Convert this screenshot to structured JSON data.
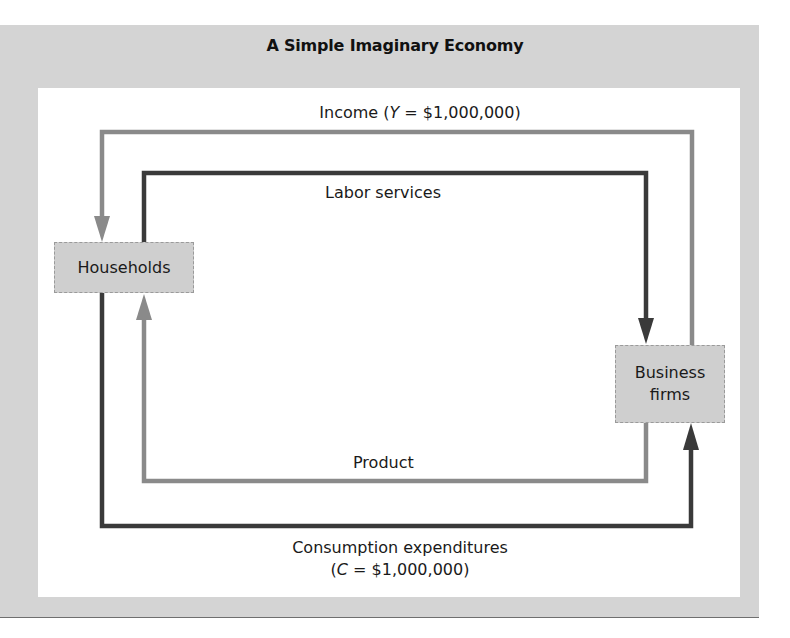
{
  "title": "A Simple Imaginary Economy",
  "nodes": {
    "households": "Households",
    "business_line1": "Business",
    "business_line2": "firms"
  },
  "flows": {
    "income": {
      "prefix": "Income (",
      "var": "Y",
      "suffix": " = $1,000,000)",
      "color": "#8a8a8a",
      "direction": "Business firms → Households"
    },
    "labor": {
      "label": "Labor services",
      "color": "#3a3a3a",
      "direction": "Households → Business firms"
    },
    "product": {
      "label": "Product",
      "color": "#8a8a8a",
      "direction": "Business firms → Households"
    },
    "consumption": {
      "label": "Consumption expenditures",
      "prefix": "(",
      "var": "C",
      "suffix": " = $1,000,000)",
      "color": "#3a3a3a",
      "direction": "Households → Business firms"
    }
  },
  "colors": {
    "frame": "#d4d4d4",
    "panel": "#ffffff",
    "box": "#cfcfcf",
    "dark_flow": "#3a3a3a",
    "light_flow": "#8a8a8a"
  }
}
